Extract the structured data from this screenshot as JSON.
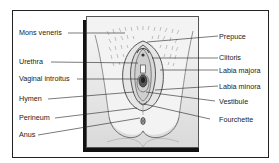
{
  "diagram": {
    "type": "labeled-anatomical-illustration",
    "labels_left": [
      {
        "id": "mons-veneris",
        "text": "Mons veneris"
      },
      {
        "id": "urethra",
        "text": "Urethra"
      },
      {
        "id": "vaginal-introitus",
        "text": "Vaginal introitus"
      },
      {
        "id": "hymen",
        "text": "Hymen"
      },
      {
        "id": "perineum",
        "text": "Perineum"
      },
      {
        "id": "anus",
        "text": "Anus"
      }
    ],
    "labels_right": [
      {
        "id": "prepuce",
        "text": "Prepuce"
      },
      {
        "id": "clitoris",
        "text": "Clitoris"
      },
      {
        "id": "labia-majora",
        "text": "Labia majora"
      },
      {
        "id": "labia-minora",
        "text": "Labia minora"
      },
      {
        "id": "vestibule",
        "text": "Vestibule"
      },
      {
        "id": "fourchette",
        "text": "Fourchette"
      }
    ],
    "colors": {
      "frame": "#222222",
      "panel_bg": "#f2f2f2",
      "shadow": "#111111",
      "text": "#222222"
    }
  }
}
